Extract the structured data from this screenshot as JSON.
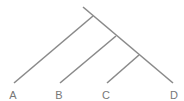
{
  "diagram": {
    "type": "cladogram",
    "line_color": "#8a8a8a",
    "leaves": [
      {
        "label": "A",
        "x": 13,
        "y": 89
      },
      {
        "label": "B",
        "x": 59,
        "y": 89
      },
      {
        "label": "C",
        "x": 106,
        "y": 89
      },
      {
        "label": "D",
        "x": 174,
        "y": 89
      }
    ],
    "edges": [
      {
        "from": "root",
        "to": "D",
        "x1": 83,
        "y1": 7,
        "x2": 173,
        "y2": 83
      },
      {
        "from": "n1",
        "to": "A",
        "x1": 93,
        "y1": 16,
        "x2": 14,
        "y2": 83
      },
      {
        "from": "n2",
        "to": "B",
        "x1": 116,
        "y1": 36,
        "x2": 60,
        "y2": 83
      },
      {
        "from": "n3",
        "to": "C",
        "x1": 139,
        "y1": 55,
        "x2": 107,
        "y2": 83
      }
    ]
  }
}
